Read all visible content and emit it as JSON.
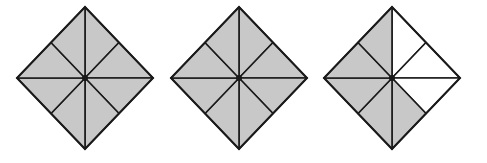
{
  "figure": {
    "colors": {
      "shaded": "#c8c8c8",
      "unshaded": "#ffffff",
      "stroke": "#1a1a1a"
    },
    "diamonds": [
      {
        "id": "diamond-1",
        "cx": 85,
        "cy": 78,
        "rx": 68,
        "ry": 71,
        "shaded_count": 8,
        "total": 8,
        "triangles": [
          true,
          true,
          true,
          true,
          true,
          true,
          true,
          true
        ]
      },
      {
        "id": "diamond-2",
        "cx": 239,
        "cy": 78,
        "rx": 68,
        "ry": 71,
        "shaded_count": 8,
        "total": 8,
        "triangles": [
          true,
          true,
          true,
          true,
          true,
          true,
          true,
          true
        ]
      },
      {
        "id": "diamond-3",
        "cx": 392,
        "cy": 78,
        "rx": 68,
        "ry": 71,
        "shaded_count": 5,
        "total": 8,
        "triangles": [
          false,
          false,
          false,
          true,
          true,
          true,
          true,
          true
        ]
      }
    ]
  }
}
